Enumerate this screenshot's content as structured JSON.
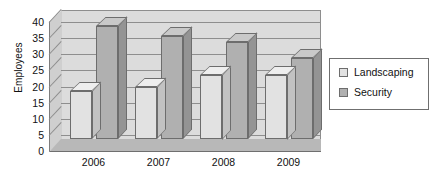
{
  "chart_data": {
    "type": "bar",
    "title": "",
    "subtitle": "",
    "xlabel": "",
    "ylabel": "Employees",
    "categories": [
      "2006",
      "2007",
      "2008",
      "2009"
    ],
    "series": [
      {
        "name": "Landscaping",
        "color": "#e2e2e2",
        "values": [
          15,
          16,
          20,
          20
        ]
      },
      {
        "name": "Security",
        "color": "#b0b0b0",
        "values": [
          35,
          32,
          30,
          25
        ]
      }
    ],
    "ylim": [
      0,
      40
    ],
    "yticks": [
      0,
      5,
      10,
      15,
      20,
      25,
      30,
      35,
      40
    ],
    "ytick_labels": [
      "0",
      "5",
      "10",
      "15",
      "20",
      "25",
      "30",
      "35",
      "40"
    ],
    "grid": true,
    "grid_axis": "y",
    "legend_position": "right",
    "style": "3d-clustered-column",
    "annotations": []
  },
  "legend": {
    "items": [
      {
        "label": "Landscaping",
        "color": "#e2e2e2"
      },
      {
        "label": "Security",
        "color": "#b0b0b0"
      }
    ]
  },
  "colors": {
    "plot_background": "#dcdcdc",
    "floor": "#b8b8b8",
    "gridline": "#8e8e8e",
    "border": "#6f6f6f",
    "text": "#111111",
    "page_background": "#ffffff"
  }
}
